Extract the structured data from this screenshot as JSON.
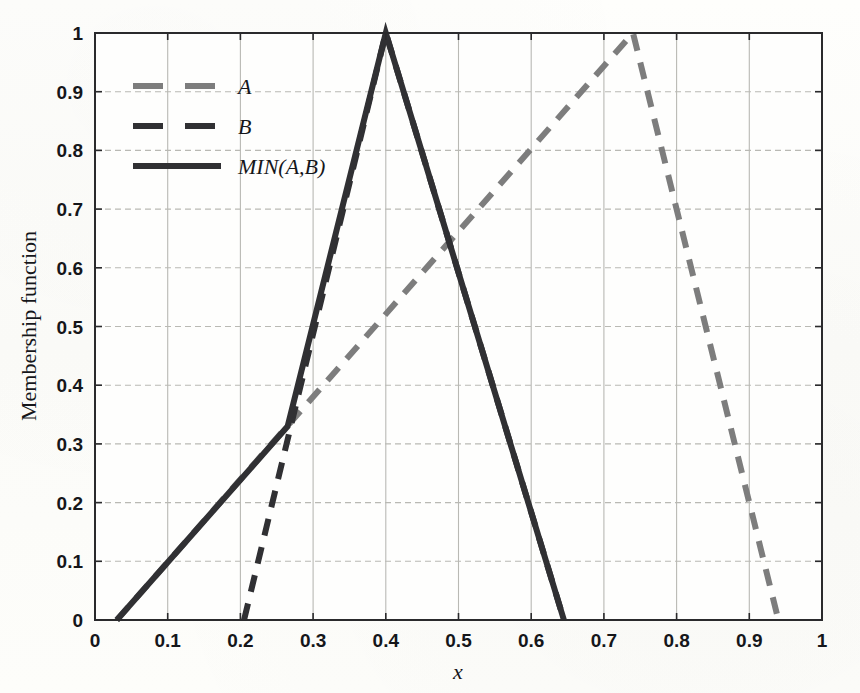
{
  "chart_data": {
    "type": "line",
    "title": "",
    "xlabel": "x",
    "ylabel": "Membership function",
    "xlim": [
      0,
      1
    ],
    "ylim": [
      0,
      1
    ],
    "grid": true,
    "legend_position": "upper-left",
    "x_ticks": [
      "0",
      "0.1",
      "0.2",
      "0.3",
      "0.4",
      "0.5",
      "0.6",
      "0.7",
      "0.8",
      "0.9",
      "1"
    ],
    "x_tick_values": [
      0,
      0.1,
      0.2,
      0.3,
      0.4,
      0.5,
      0.6,
      0.7,
      0.8,
      0.9,
      1
    ],
    "y_ticks": [
      "0",
      "0.1",
      "0.2",
      "0.3",
      "0.4",
      "0.5",
      "0.6",
      "0.7",
      "0.8",
      "0.9",
      "1"
    ],
    "y_tick_values": [
      0,
      0.1,
      0.2,
      0.3,
      0.4,
      0.5,
      0.6,
      0.7,
      0.8,
      0.9,
      1
    ],
    "series": [
      {
        "name": "A",
        "style": "dashed",
        "color": "#7d7d7d",
        "width": 6,
        "points": [
          [
            0.03,
            0
          ],
          [
            0.74,
            1
          ],
          [
            0.94,
            0
          ]
        ]
      },
      {
        "name": "B",
        "style": "dashed",
        "color": "#303033",
        "width": 6,
        "points": [
          [
            0.205,
            0
          ],
          [
            0.4,
            1
          ],
          [
            0.645,
            0
          ]
        ]
      },
      {
        "name": "MIN(A,B)",
        "style": "solid",
        "color": "#303033",
        "width": 6,
        "points": [
          [
            0.03,
            0
          ],
          [
            0.265,
            0.33
          ],
          [
            0.4,
            1
          ],
          [
            0.645,
            0
          ]
        ]
      }
    ]
  },
  "legend": {
    "entries": [
      {
        "label": "A"
      },
      {
        "label": "B"
      },
      {
        "label": "MIN(A,B)"
      }
    ]
  },
  "axes": {
    "x_title": "x",
    "y_title": "Membership function"
  },
  "colors": {
    "series_a": "#7d7d7d",
    "series_b": "#303033",
    "series_min": "#303033",
    "grid": "#b9b9b4",
    "axis": "#2a2a2c",
    "background": "#fdfdfb"
  }
}
